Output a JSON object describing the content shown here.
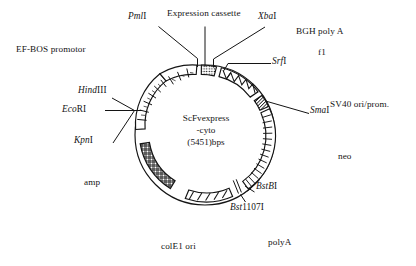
{
  "figure": {
    "kind": "plasmid-map",
    "center_lines": [
      "ScFvexpress",
      "-cyto",
      "(5451)bps"
    ],
    "background": "#ffffff",
    "ink": "#141414"
  },
  "labels": {
    "expression_cassette": "Expression cassette",
    "ef_bos_promotor": "EF-BOS promotor",
    "bgh_poly_a": "BGH poly A",
    "f1": "f1",
    "sv40_ori_prom": "SV40 ori/prom.",
    "neo": "neo",
    "poly_a": "polyA",
    "cole1_ori": "colE1 ori",
    "amp": "amp"
  },
  "enzymes": [
    {
      "id": "pmli",
      "italic": "Pml",
      "roman": "I"
    },
    {
      "id": "xbai",
      "italic": "Xba",
      "roman": "I"
    },
    {
      "id": "srfi",
      "italic": "Srf",
      "roman": "I"
    },
    {
      "id": "smai",
      "italic": "Sma",
      "roman": "I"
    },
    {
      "id": "hindiii",
      "italic": "Hind",
      "roman": "III"
    },
    {
      "id": "ecori",
      "italic": "Eco",
      "roman": "RI"
    },
    {
      "id": "kpni",
      "italic": "Kpn",
      "roman": "I"
    },
    {
      "id": "bstbi",
      "italic": "BstB",
      "roman": "I"
    },
    {
      "id": "bst1107i",
      "italic": "Bst",
      "roman": "1107I"
    }
  ],
  "enzyme_text": {
    "pmli_i": "Pml",
    "pmli_r": "I",
    "xbai_i": "Xba",
    "xbai_r": "I",
    "srfi_i": "Srf",
    "srfi_r": "I",
    "smai_i": "Sma",
    "smai_r": "I",
    "hindiii_i": "Hind",
    "hindiii_r": "III",
    "ecori_i": "Eco",
    "ecori_r": "RI",
    "kpni_i": "Kpn",
    "kpni_r": "I",
    "bstbi_i": "BstB",
    "bstbi_r": "I",
    "bst1107i_i": "Bst",
    "bst1107i_r": "1107I"
  },
  "center": {
    "line1": "ScFvexpress",
    "line2": "-cyto",
    "line3": "(5451)bps"
  },
  "map_geometry": {
    "cx": 205,
    "cy": 135,
    "radius": 70,
    "band_width": 9
  },
  "segments": [
    {
      "name": "ef-bos-promotor-arc",
      "pattern": "ladder-blocks",
      "start_deg": 182,
      "end_deg": 268
    },
    {
      "name": "expression-cassette-arc",
      "pattern": "dotted",
      "start_deg": 272,
      "end_deg": 283
    },
    {
      "name": "bgh-poly-a-arc",
      "pattern": "zigzag",
      "start_deg": 288,
      "end_deg": 325
    },
    {
      "name": "sv40-neo-arc",
      "pattern": "dark-solid",
      "start_deg": 342,
      "end_deg": 352
    },
    {
      "name": "neo-arc",
      "pattern": "horizontal-rungs",
      "start_deg": 353,
      "end_deg": 52
    },
    {
      "name": "cole1-ori-arc",
      "pattern": "diagonal-slashes",
      "start_deg": 65,
      "end_deg": 108
    },
    {
      "name": "amp-arc",
      "pattern": "cross-hatch",
      "start_deg": 120,
      "end_deg": 176
    }
  ]
}
